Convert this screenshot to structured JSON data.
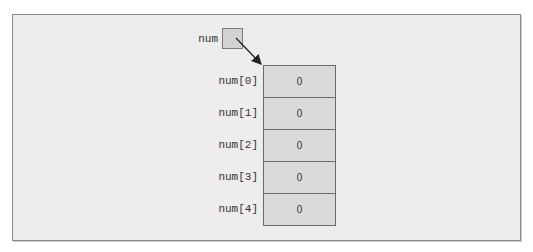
{
  "pointer": {
    "label": "num"
  },
  "array": {
    "cells": [
      {
        "label": "num[0]",
        "value": "0"
      },
      {
        "label": "num[1]",
        "value": "0"
      },
      {
        "label": "num[2]",
        "value": "0"
      },
      {
        "label": "num[3]",
        "value": "0"
      },
      {
        "label": "num[4]",
        "value": "0"
      }
    ]
  },
  "colors": {
    "cell_fill": "#d9d9d9",
    "frame_bg": "#ededed",
    "border": "#6a6a6a"
  }
}
